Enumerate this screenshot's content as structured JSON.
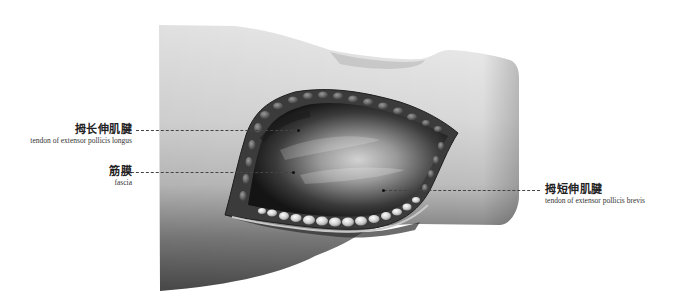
{
  "figure": {
    "colors": {
      "background": "#ffffff",
      "skin_light": "#e6e6e6",
      "skin_dark": "#5a5a5a",
      "wound_dark": "#1c1c1c",
      "fat": "#d8d8d8",
      "leader": "#444444"
    }
  },
  "labels": [
    {
      "id": "epl",
      "zh": "拇长伸肌腱",
      "en": "tendon of extensor pollicis longus",
      "side": "left"
    },
    {
      "id": "fascia",
      "zh": "筋膜",
      "en": "fascia",
      "side": "left"
    },
    {
      "id": "epb",
      "zh": "拇短伸肌腱",
      "en": "tendon of extensor pollicis brevis",
      "side": "right"
    }
  ]
}
